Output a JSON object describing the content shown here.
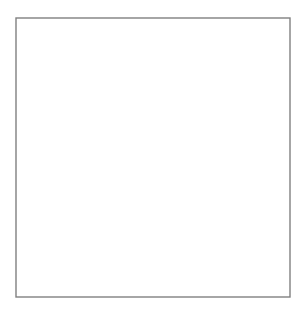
{
  "figure": {
    "type": "field-line-diagram",
    "caption": "",
    "width": 306,
    "height": 316,
    "background_color": "#ffffff"
  },
  "frame": {
    "x": 16,
    "y": 18,
    "width": 274,
    "height": 279,
    "stroke_color": "#808080",
    "stroke_width": 1.4,
    "fill": "#ffffff"
  },
  "style": {
    "solid_line_color": "#1a1a1a",
    "solid_line_width": 1.25,
    "dashed_line_color": "#8a8a8a",
    "dashed_line_width": 1.1,
    "dash_pattern": "5 4",
    "planet_stroke_color": "#1a1a1a",
    "planet_fill_color": "#ffffff"
  },
  "planet": {
    "label": "planet",
    "center_x": 16,
    "center_y": 148,
    "radius": 65,
    "clipped_at_left_frame": true
  },
  "neutral_point": {
    "label": "x-point",
    "x": 183,
    "y": 148
  },
  "axis_of_symmetry": {
    "label": "equatorial-plane",
    "y": 148
  },
  "chart_data": {
    "type": "line",
    "xlabel": "",
    "ylabel": "",
    "grid": false,
    "legend": null,
    "xlim": [
      16,
      290
    ],
    "ylim": [
      18,
      297
    ],
    "series": [
      {
        "name": "solid-field-lines",
        "style": "solid",
        "color": "#1a1a1a",
        "paths": [
          "M 16 81 C 40 80 62 76 78 71 C 104 62 122 45 131 18",
          "M 16 81 C 44 83 66 83 86 80 C 118 74 142 54 158 18",
          "M 16 84 C 52 88 80 90 106 87 C 146 82 178 60 206 18",
          "M 16 90 C 58 97 96 102 130 99 C 186 95 232 72 290 33",
          "M 18 99 C 62 110 112 120 154 120 C 208 119 250 100 290 75",
          "M 22 112 C 60 123 96 132 128 136 C 158 140 176 143 183 148 C 196 148 222 146 252 141 C 268 138 280 136 290 135",
          "M 25 121 C 54 129 80 136 102 142 C 118 146 127 147 132 148 C 142 148 158 148 176 148 C 206 148 250 149 290 151",
          "M 30 130 C 48 134 64 139 76 144 C 84 147 88 147 92 148 C 104 148 124 148 144 148 C 186 148 240 150 290 152",
          "M 40 139 C 50 142 58 145 63 147 C 66 148 68 148 70 148 C 80 148 96 148 112 148 C 160 149 230 151 290 153",
          "M 30 166 C 48 162 64 157 76 152 C 84 149 88 149 92 148",
          "M 25 175 C 54 167 80 160 102 154 C 118 150 127 149 132 148",
          "M 22 184 C 60 173 96 164 128 160 C 158 156 176 153 183 148",
          "M 18 197 C 62 186 112 176 154 176 C 208 177 250 196 290 222",
          "M 16 206 C 58 199 96 194 130 197 C 186 201 232 224 290 262",
          "M 16 212 C 52 208 80 206 106 209 C 146 214 178 236 206 278",
          "M 16 215 C 44 213 66 213 86 216 C 118 222 142 242 158 278",
          "M 16 215 C 40 216 62 220 78 225 C 104 234 122 251 131 278",
          "M 16 78 C 34 76 50 70 62 60 C 76 48 86 34 93 18",
          "M 16 218 C 34 220 50 226 62 236 C 76 248 86 262 93 278",
          "M 16 75 C 30 72 42 64 52 52 C 62 40 68 28 71 18",
          "M 16 221 C 30 224 42 232 52 244 C 62 256 68 268 71 278",
          "M 16 72 C 26 68 34 58 40 46 C 46 35 49 25 50 18",
          "M 16 224 C 26 228 34 238 40 250 C 46 261 49 271 50 278",
          "M 16 88 C 46 93 72 96 94 94 C 118 92 136 80 148 56",
          "M 16 208 C 46 203 72 200 94 202 C 118 204 136 216 148 240",
          "M 22 106 C 54 113 84 120 108 124 C 132 128 148 134 158 148",
          "M 22 190 C 54 183 84 176 108 172 C 132 168 148 162 158 148",
          "M 27 126 C 46 132 64 139 78 145 C 84 147 88 148 92 148",
          "M 27 170 C 46 164 64 157 78 151 C 84 149 88 148 92 148"
        ]
      },
      {
        "name": "dashed-model-lines",
        "style": "dashed",
        "color": "#8a8a8a",
        "paths": [
          "M 78 18 C 92 44 106 62 124 74 C 148 90 178 98 208 100 C 232 101 258 101 272 100",
          "M 78 278 C 92 252 106 234 124 222 C 148 206 178 198 208 196 C 232 195 258 195 272 196",
          "M 272 100 C 282 116 286 132 286 148 C 286 164 282 180 272 196",
          "M 60 62 C 74 52 90 44 106 38 C 120 33 132 28 140 18",
          "M 60 234 C 74 244 90 252 106 258 C 120 263 132 268 140 278",
          "M 66 74 C 88 63 112 54 130 42 C 144 33 154 26 160 18",
          "M 66 222 C 88 233 112 242 130 254 C 144 263 154 270 160 278",
          "M 72 88 C 100 80 130 70 152 56 C 168 45 178 32 184 18",
          "M 72 208 C 100 216 130 226 152 240 C 168 251 178 264 184 278",
          "M 76 100 C 108 96 142 88 166 74 C 186 62 200 44 210 20",
          "M 76 196 C 108 200 142 208 166 222 C 186 234 200 252 210 276",
          "M 78 110 C 104 110 130 108 150 100 C 170 92 184 78 192 60",
          "M 78 186 C 104 186 130 188 150 196 C 170 204 184 218 192 236",
          "M 82 118 C 102 120 122 120 138 116 C 154 112 166 102 174 88",
          "M 82 178 C 102 176 122 176 138 180 C 154 184 166 194 174 208",
          "M 88 126 C 100 129 112 130 122 128 C 134 126 142 120 148 110",
          "M 88 170 C 100 167 112 166 122 168 C 134 170 142 176 148 186",
          "M 94 134 C 102 136 108 137 114 136 C 120 135 124 132 128 126",
          "M 94 162 C 102 160 108 159 114 160 C 120 161 124 164 128 170",
          "M 100 140 C 105 142 109 143 112 143 C 115 143 117 142 119 140",
          "M 100 156 C 105 154 109 153 112 153 C 115 153 117 154 119 156"
        ]
      }
    ]
  }
}
